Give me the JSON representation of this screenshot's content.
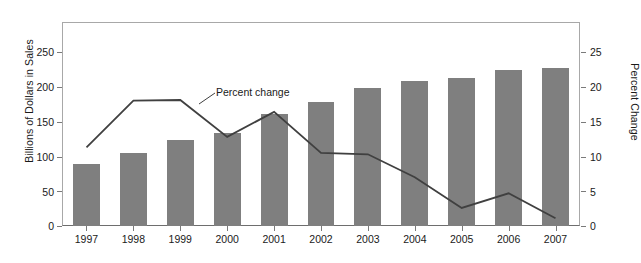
{
  "chart_data": {
    "type": "bar",
    "title": "",
    "subtitle": "",
    "xlabel": "",
    "ylabel": "Billions of Dollars in Sales",
    "y2label": "Percent Change",
    "categories": [
      "1997",
      "1998",
      "1999",
      "2000",
      "2001",
      "2002",
      "2003",
      "2004",
      "2005",
      "2006",
      "2007"
    ],
    "ylim": [
      0,
      250
    ],
    "y2lim": [
      0,
      25
    ],
    "yticks": [
      0,
      50,
      100,
      150,
      200,
      250
    ],
    "y2ticks": [
      0,
      5,
      10,
      15,
      20,
      25
    ],
    "grid": false,
    "legend_position": "inline-annotation",
    "series": [
      {
        "name": "Billions of Dollars in Sales",
        "type": "bar",
        "axis": "left",
        "color": "#7f7f7f",
        "values": [
          89,
          105,
          123,
          134,
          161,
          178,
          198,
          209,
          213,
          224,
          227
        ]
      },
      {
        "name": "Percent change",
        "type": "line",
        "axis": "right",
        "color": "#404040",
        "values": [
          11.3,
          18.0,
          18.1,
          12.8,
          16.4,
          10.5,
          10.3,
          7.0,
          2.6,
          4.7,
          1.1
        ]
      }
    ],
    "annotations": [
      {
        "text": "Percent change",
        "x": "2000",
        "y": 18.2
      }
    ]
  },
  "axes": {
    "left_title": "Billions of Dollars in Sales",
    "right_title": "Percent Change",
    "left_ticks": [
      "250",
      "200",
      "150",
      "100",
      "50",
      "0"
    ],
    "right_ticks": [
      "25",
      "20",
      "15",
      "10",
      "5",
      "0"
    ]
  },
  "annotation_label": "Percent change"
}
